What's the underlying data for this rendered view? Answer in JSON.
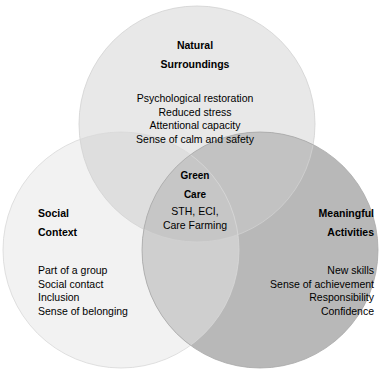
{
  "diagram": {
    "type": "venn",
    "title": "Green Care",
    "background_color": "#ffffff",
    "text_color": "#000000",
    "sets": [
      {
        "id": "natural_surroundings",
        "heading_line_1": "Natural",
        "heading_line_2": "Surroundings",
        "fill_color": "#e8e8e8",
        "items": [
          "Psychological restoration",
          "Reduced stress",
          "Attentional capacity",
          "Sense of calm and safety"
        ]
      },
      {
        "id": "social_context",
        "heading_line_1": "Social",
        "heading_line_2": "Context",
        "fill_color": "#f2f2f2",
        "items": [
          "Part of a group",
          "Social contact",
          "Inclusion",
          "Sense of belonging"
        ]
      },
      {
        "id": "meaningful_activities",
        "heading_line_1": "Meaningful",
        "heading_line_2": "Activities",
        "fill_color": "#b8b8b8",
        "items": [
          "New skills",
          "Sense of achievement",
          "Responsibility",
          "Confidence"
        ]
      }
    ],
    "intersection": {
      "id": "green_care",
      "heading_line_1": "Green",
      "heading_line_2": "Care",
      "items": [
        "STH, ECI,",
        "Care Farming"
      ]
    }
  }
}
